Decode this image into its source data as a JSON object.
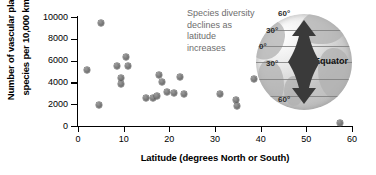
{
  "chart_data": {
    "type": "scatter",
    "title": "",
    "xlabel": "Latitude (degrees North or South)",
    "ylabel": "Number of vascular plant species per 10,000 km2",
    "ylabel_line1": "Number of vascular plant",
    "ylabel_line2_pre": "species per 10,000 km",
    "ylabel_line2_sup": "2",
    "xlim": [
      0,
      60
    ],
    "ylim": [
      0,
      10000
    ],
    "xticks": [
      0,
      10,
      20,
      30,
      40,
      50,
      60
    ],
    "yticks": [
      0,
      2000,
      4000,
      6000,
      8000,
      10000
    ],
    "ytick_labels": [
      "0",
      "2000",
      "4000",
      "6000",
      "8000",
      "10000"
    ],
    "xtick_labels": [
      "0",
      "10",
      "20",
      "30",
      "40",
      "50",
      "60"
    ],
    "grid": false,
    "legend": false,
    "marker_color": "#6f6f6f",
    "points": [
      {
        "x": 2.0,
        "y": 5100
      },
      {
        "x": 4.6,
        "y": 1900
      },
      {
        "x": 5.1,
        "y": 9500
      },
      {
        "x": 8.6,
        "y": 5500
      },
      {
        "x": 9.3,
        "y": 4400
      },
      {
        "x": 9.4,
        "y": 3850
      },
      {
        "x": 10.6,
        "y": 6350
      },
      {
        "x": 11.0,
        "y": 5500
      },
      {
        "x": 14.8,
        "y": 2550
      },
      {
        "x": 16.4,
        "y": 2600
      },
      {
        "x": 17.3,
        "y": 2750
      },
      {
        "x": 17.8,
        "y": 4700
      },
      {
        "x": 18.4,
        "y": 4050
      },
      {
        "x": 19.4,
        "y": 3150
      },
      {
        "x": 21.0,
        "y": 3050
      },
      {
        "x": 22.4,
        "y": 4500
      },
      {
        "x": 23.1,
        "y": 2900
      },
      {
        "x": 31.0,
        "y": 2950
      },
      {
        "x": 34.6,
        "y": 2350
      },
      {
        "x": 34.7,
        "y": 1850
      },
      {
        "x": 38.6,
        "y": 4300
      },
      {
        "x": 57.4,
        "y": 300
      }
    ],
    "annotation": {
      "text": "Species diversity declines as latitude increases",
      "lines": [
        "Species diversity",
        "declines as",
        "latitude",
        "increases"
      ],
      "color": "#6d6d6d"
    }
  },
  "inset": {
    "name": "globe-diagram",
    "equator_label": "Equator",
    "latitude_labels": [
      {
        "text": "60°",
        "position": "north"
      },
      {
        "text": "30°",
        "position": "north-mid"
      },
      {
        "text": "0°",
        "position": "equator"
      },
      {
        "text": "30°",
        "position": "south-mid"
      },
      {
        "text": "60°",
        "position": "south"
      }
    ],
    "arrow_description": "double-headed vertical arrow, widest at the equator"
  }
}
